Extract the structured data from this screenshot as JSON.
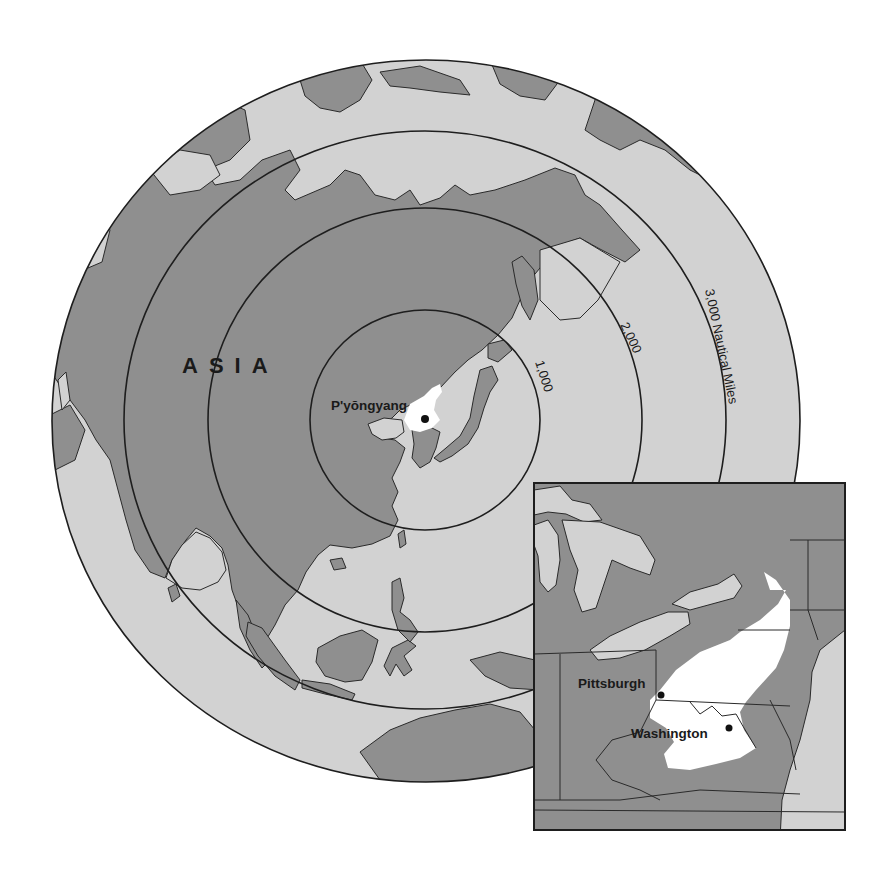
{
  "map": {
    "title": "Range rings from P'yŏngyang",
    "projection": "azimuthal, centered on P'yŏngyang",
    "colors": {
      "land": "#8f8f8f",
      "ocean": "#d2d2d2",
      "highlight": "#ffffff",
      "lines": "#1e1e1e",
      "background": "#ffffff"
    },
    "region_labels": [
      {
        "id": "asia",
        "text": "ASIA"
      }
    ],
    "center_city": {
      "name": "P'yŏngyang",
      "label": "P'yŏngyang"
    },
    "range_rings": [
      {
        "distance": 1000,
        "label": "1,000"
      },
      {
        "distance": 2000,
        "label": "2,000"
      },
      {
        "distance": 3000,
        "label": "3,000",
        "unit_label": "Nautical Miles"
      }
    ],
    "ring_labels": {
      "r1000": "1,000",
      "r2000": "2,000",
      "r3000": "3,000 Nautical Miles"
    }
  },
  "inset": {
    "description": "Comparable area in the eastern United States",
    "cities": [
      {
        "id": "pittsburgh",
        "label": "Pittsburgh"
      },
      {
        "id": "washington",
        "label": "Washington"
      }
    ]
  }
}
